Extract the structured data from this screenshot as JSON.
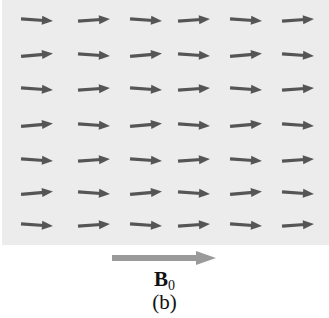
{
  "figure": {
    "panel_color": "#ececec",
    "arrow_color": "#555555",
    "b0_arrow_color": "#9a9a9a",
    "grid": {
      "columns_x": [
        37,
        94,
        146,
        194,
        246,
        298
      ],
      "rows_y": [
        20,
        55,
        89,
        125,
        160,
        193,
        225
      ],
      "arrow_length": 32,
      "tilts_deg": [
        [
          4,
          -4,
          4,
          -4,
          4,
          -4
        ],
        [
          -5,
          4,
          -5,
          4,
          -5,
          4
        ],
        [
          4,
          -4,
          4,
          -4,
          4,
          -4
        ],
        [
          -5,
          4,
          -5,
          4,
          -5,
          4
        ],
        [
          4,
          -4,
          4,
          -4,
          4,
          -4
        ],
        [
          -5,
          4,
          -5,
          4,
          -5,
          4
        ],
        [
          4,
          -4,
          4,
          -4,
          4,
          -4
        ]
      ]
    },
    "field_label": {
      "symbol": "B",
      "subscript": "0"
    },
    "caption": "(b)"
  }
}
